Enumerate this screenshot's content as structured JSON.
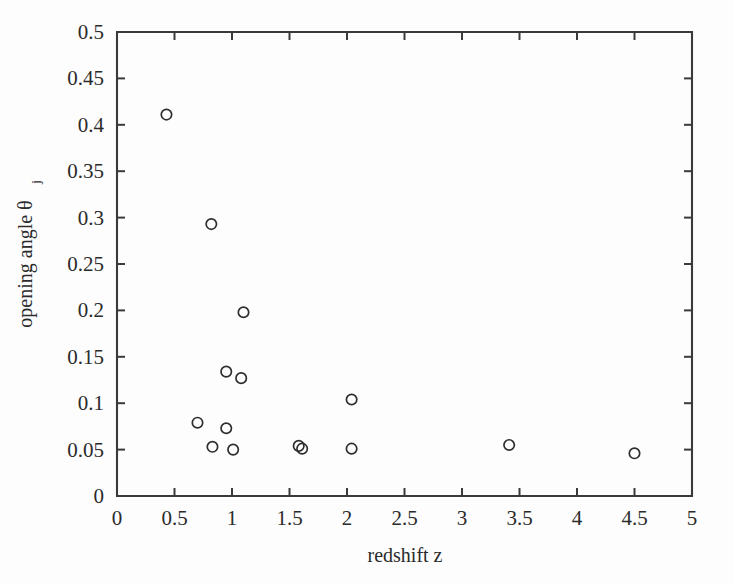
{
  "chart_data": {
    "type": "scatter",
    "title": "",
    "xlabel": "redshift z",
    "ylabel": "opening angle θ",
    "ylabel_subscript": "j",
    "xlim": [
      0,
      5
    ],
    "ylim": [
      0,
      0.5
    ],
    "grid": false,
    "legend": null,
    "marker": "open-circle",
    "xticks": [
      0,
      0.5,
      1,
      1.5,
      2,
      2.5,
      3,
      3.5,
      4,
      4.5,
      5
    ],
    "xtick_labels": [
      "0",
      "0.5",
      "1",
      "1.5",
      "2",
      "2.5",
      "3",
      "3.5",
      "4",
      "4.5",
      "5"
    ],
    "yticks": [
      0,
      0.05,
      0.1,
      0.15,
      0.2,
      0.25,
      0.3,
      0.35,
      0.4,
      0.45,
      0.5
    ],
    "ytick_labels": [
      "0",
      "0.05",
      "0.1",
      "0.15",
      "0.2",
      "0.25",
      "0.3",
      "0.35",
      "0.4",
      "0.45",
      "0.5"
    ],
    "series": [
      {
        "name": "GRB jet opening angles",
        "points": [
          {
            "x": 0.43,
            "y": 0.411
          },
          {
            "x": 0.82,
            "y": 0.293
          },
          {
            "x": 1.1,
            "y": 0.198
          },
          {
            "x": 0.95,
            "y": 0.134
          },
          {
            "x": 1.08,
            "y": 0.127
          },
          {
            "x": 2.04,
            "y": 0.104
          },
          {
            "x": 0.7,
            "y": 0.079
          },
          {
            "x": 0.95,
            "y": 0.073
          },
          {
            "x": 0.83,
            "y": 0.053
          },
          {
            "x": 1.01,
            "y": 0.05
          },
          {
            "x": 1.58,
            "y": 0.054
          },
          {
            "x": 1.61,
            "y": 0.051
          },
          {
            "x": 2.04,
            "y": 0.051
          },
          {
            "x": 3.41,
            "y": 0.055
          },
          {
            "x": 4.5,
            "y": 0.046
          }
        ]
      }
    ]
  },
  "figure": {
    "background_color": "#fdfdfd",
    "axis_color": "#3a3a3a",
    "marker_color": "#2e2e2e"
  }
}
